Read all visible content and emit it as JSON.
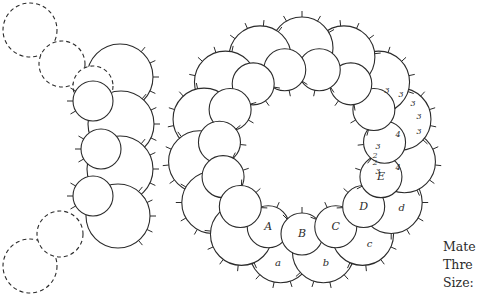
{
  "diagram": {
    "colors": {
      "stroke": "#2b2b2b",
      "background": "#ffffff",
      "text": "#2a2a2a"
    },
    "ring_labels": [
      "A",
      "B",
      "C",
      "D",
      "E"
    ],
    "chain_labels": [
      "a",
      "b",
      "c",
      "d"
    ],
    "stitch_counts": [
      "3",
      "3",
      "3",
      "3",
      "3",
      "4",
      "4",
      "3",
      "2",
      "2",
      "3"
    ]
  },
  "legend": {
    "material": "Mate",
    "thread": "Thre",
    "size": "Size:"
  }
}
